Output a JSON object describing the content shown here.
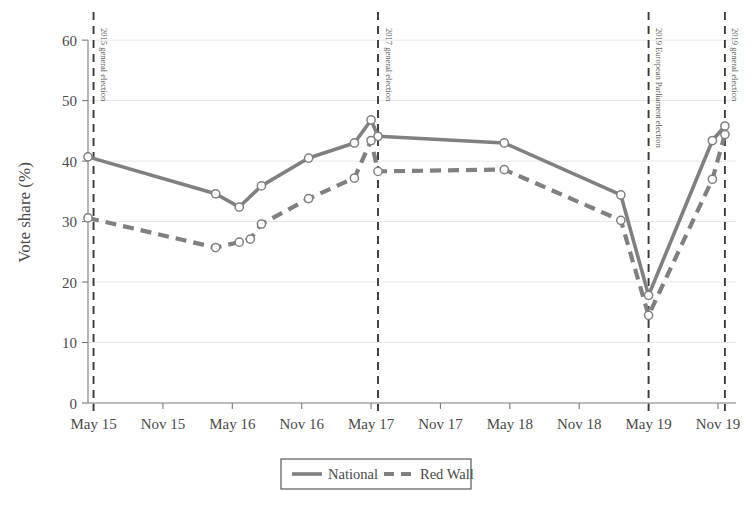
{
  "chart_data": {
    "type": "line",
    "title": "",
    "xlabel": "",
    "ylabel": "Vote share (%)",
    "ylim": [
      0,
      63
    ],
    "yticks": [
      0,
      10,
      20,
      30,
      40,
      50,
      60
    ],
    "ytick_labels": [
      "0",
      "10",
      "20",
      "30",
      "40",
      "50",
      "60"
    ],
    "xtick_labels": [
      "May 15",
      "Nov 15",
      "May 16",
      "Nov 16",
      "May 17",
      "Nov 17",
      "May 18",
      "Nov 18",
      "May 19",
      "Nov 19"
    ],
    "xlim": [
      2015.33,
      2020.0
    ],
    "grid": true,
    "legend_position": "bottom",
    "marker": "circle-open",
    "series": [
      {
        "name": "National",
        "style": "solid",
        "color": "#808080",
        "points": [
          {
            "x": 2015.33,
            "y": 40.7
          },
          {
            "x": 2016.25,
            "y": 34.6
          },
          {
            "x": 2016.42,
            "y": 32.4
          },
          {
            "x": 2016.58,
            "y": 35.9
          },
          {
            "x": 2016.92,
            "y": 40.5
          },
          {
            "x": 2017.25,
            "y": 43.0
          },
          {
            "x": 2017.37,
            "y": 46.8
          },
          {
            "x": 2017.42,
            "y": 44.1
          },
          {
            "x": 2018.33,
            "y": 43.0
          },
          {
            "x": 2019.17,
            "y": 34.4
          },
          {
            "x": 2019.37,
            "y": 17.8
          },
          {
            "x": 2019.83,
            "y": 43.4
          },
          {
            "x": 2019.92,
            "y": 45.8
          }
        ]
      },
      {
        "name": "Red Wall",
        "style": "dashed",
        "color": "#808080",
        "points": [
          {
            "x": 2015.33,
            "y": 30.6
          },
          {
            "x": 2016.25,
            "y": 25.7
          },
          {
            "x": 2016.42,
            "y": 26.6
          },
          {
            "x": 2016.5,
            "y": 27.1
          },
          {
            "x": 2016.58,
            "y": 29.6
          },
          {
            "x": 2016.92,
            "y": 33.8
          },
          {
            "x": 2017.25,
            "y": 37.2
          },
          {
            "x": 2017.37,
            "y": 43.4
          },
          {
            "x": 2017.42,
            "y": 38.3
          },
          {
            "x": 2018.33,
            "y": 38.6
          },
          {
            "x": 2019.17,
            "y": 30.2
          },
          {
            "x": 2019.37,
            "y": 14.5
          },
          {
            "x": 2019.83,
            "y": 37.0
          },
          {
            "x": 2019.92,
            "y": 44.4
          }
        ]
      }
    ],
    "event_lines": [
      {
        "x": 2015.37,
        "label": "2015 general election"
      },
      {
        "x": 2017.42,
        "label": "2017 general election"
      },
      {
        "x": 2019.37,
        "label": "2019 European Parliament election"
      },
      {
        "x": 2019.92,
        "label": "2019 general election"
      }
    ],
    "legend": [
      {
        "label": "National",
        "style": "solid"
      },
      {
        "label": "Red Wall",
        "style": "dashed"
      }
    ]
  }
}
